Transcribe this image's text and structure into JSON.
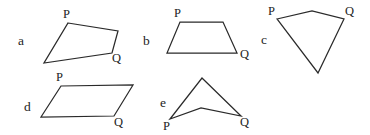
{
  "figure": {
    "background_color": "#ffffff",
    "stroke_color": "#2a2a2a",
    "text_color": "#1e1e1e",
    "width": 370,
    "height": 135
  },
  "shapes": [
    {
      "id": "a",
      "item_label": "a",
      "item_label_pos": {
        "x": 18,
        "y": 45
      },
      "kind": "convex-quadrilateral",
      "points": "68,23 118,31 112,53 44,63",
      "vertex_labels": [
        {
          "name": "P",
          "text": "P",
          "x": 63,
          "y": 18
        },
        {
          "name": "Q",
          "text": "Q",
          "x": 112,
          "y": 62
        }
      ]
    },
    {
      "id": "b",
      "item_label": "b",
      "item_label_pos": {
        "x": 143,
        "y": 45
      },
      "kind": "trapezoid",
      "points": "180,22 223,22 237,53 167,53",
      "vertex_labels": [
        {
          "name": "P",
          "text": "P",
          "x": 174,
          "y": 17
        },
        {
          "name": "Q",
          "text": "Q",
          "x": 240,
          "y": 58
        }
      ]
    },
    {
      "id": "c",
      "item_label": "c",
      "item_label_pos": {
        "x": 261,
        "y": 44
      },
      "kind": "kite-quadrilateral",
      "points": "277,19 312,11 344,19 318,73",
      "vertex_labels": [
        {
          "name": "P",
          "text": "P",
          "x": 268,
          "y": 15
        },
        {
          "name": "Q",
          "text": "Q",
          "x": 345,
          "y": 15
        }
      ]
    },
    {
      "id": "d",
      "item_label": "d",
      "item_label_pos": {
        "x": 24,
        "y": 111
      },
      "kind": "parallelogram",
      "points": "61,86 133,85 114,116 41,117",
      "vertex_labels": [
        {
          "name": "P",
          "text": "P",
          "x": 56,
          "y": 81
        },
        {
          "name": "Q",
          "text": "Q",
          "x": 114,
          "y": 126
        }
      ]
    },
    {
      "id": "e",
      "item_label": "e",
      "item_label_pos": {
        "x": 160,
        "y": 107
      },
      "kind": "concave-dart-quadrilateral",
      "points": "202,78 241,116 201,108 170,119",
      "vertex_labels": [
        {
          "name": "P",
          "text": "P",
          "x": 163,
          "y": 130
        },
        {
          "name": "Q",
          "text": "Q",
          "x": 240,
          "y": 126
        }
      ]
    }
  ]
}
